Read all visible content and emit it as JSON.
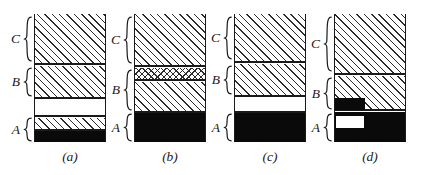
{
  "figure": {
    "width": 432,
    "height": 175,
    "background": "#ffffff",
    "ink": "#1a1a1a",
    "fill_black": "#0a0a0a"
  },
  "tier_labels": {
    "c": "C",
    "b": "B",
    "a": "A"
  },
  "panels": [
    {
      "id": "panel-a",
      "caption": "(a)",
      "column": {
        "left": 34,
        "width": 72
      },
      "caption_center": 70,
      "bands": [
        {
          "name": "band-c-hatch",
          "fill": "hatch",
          "top": 0,
          "height": 50
        },
        {
          "name": "band-b-hatch",
          "fill": "hatch",
          "top": 52,
          "height": 32
        },
        {
          "name": "band-gap-blank",
          "fill": "blank",
          "top": 86,
          "height": 16
        },
        {
          "name": "band-a-hatch",
          "fill": "hatch",
          "top": 104,
          "height": 12
        },
        {
          "name": "band-a-solid",
          "fill": "solid",
          "top": 116,
          "height": 12
        }
      ],
      "rules": [
        50,
        84,
        102,
        116
      ],
      "insets": [],
      "braces": [
        {
          "name": "brace-c",
          "tier": "C",
          "top": 2,
          "height": 46
        },
        {
          "name": "brace-b",
          "tier": "B",
          "top": 53,
          "height": 30
        },
        {
          "name": "brace-a",
          "tier": "A",
          "top": 103,
          "height": 25
        }
      ]
    },
    {
      "id": "panel-b",
      "caption": "(b)",
      "column": {
        "left": 134,
        "width": 72
      },
      "caption_center": 170,
      "bands": [
        {
          "name": "band-c-hatch",
          "fill": "hatch",
          "top": 0,
          "height": 52
        },
        {
          "name": "band-crosshatch",
          "fill": "crosshatch",
          "top": 54,
          "height": 12
        },
        {
          "name": "band-b-hatch",
          "fill": "hatch",
          "top": 68,
          "height": 30
        },
        {
          "name": "band-a-solid",
          "fill": "solid",
          "top": 98,
          "height": 30
        }
      ],
      "rules": [
        52,
        66,
        98
      ],
      "insets": [],
      "braces": [
        {
          "name": "brace-c",
          "tier": "C",
          "top": 2,
          "height": 48
        },
        {
          "name": "brace-b",
          "tier": "B",
          "top": 55,
          "height": 42
        },
        {
          "name": "brace-a",
          "tier": "A",
          "top": 99,
          "height": 29
        }
      ]
    },
    {
      "id": "panel-c",
      "caption": "(c)",
      "column": {
        "left": 234,
        "width": 72
      },
      "caption_center": 270,
      "bands": [
        {
          "name": "band-c-hatch",
          "fill": "hatch",
          "top": 0,
          "height": 48
        },
        {
          "name": "band-b-hatch",
          "fill": "hatch",
          "top": 50,
          "height": 32
        },
        {
          "name": "band-gap-blank",
          "fill": "blank",
          "top": 84,
          "height": 14
        },
        {
          "name": "band-a-solid",
          "fill": "solid",
          "top": 98,
          "height": 30
        }
      ],
      "rules": [
        48,
        82,
        98
      ],
      "insets": [],
      "braces": [
        {
          "name": "brace-c",
          "tier": "C",
          "top": 2,
          "height": 44
        },
        {
          "name": "brace-b",
          "tier": "B",
          "top": 51,
          "height": 30
        },
        {
          "name": "brace-a",
          "tier": "A",
          "top": 99,
          "height": 29
        }
      ]
    },
    {
      "id": "panel-d",
      "caption": "(d)",
      "column": {
        "left": 334,
        "width": 72
      },
      "caption_center": 370,
      "bands": [
        {
          "name": "band-c-hatch",
          "fill": "hatch",
          "top": 0,
          "height": 60
        },
        {
          "name": "band-b-hatch",
          "fill": "hatch",
          "top": 62,
          "height": 34
        },
        {
          "name": "band-a-solid",
          "fill": "solid",
          "top": 98,
          "height": 30
        }
      ],
      "rules": [
        60,
        96
      ],
      "insets": [
        {
          "name": "inset-black-block-b",
          "style": "black",
          "left": 0,
          "top": 84,
          "width": 30,
          "height": 12
        },
        {
          "name": "inset-white-block-a",
          "style": "white",
          "left": 0,
          "top": 101,
          "width": 30,
          "height": 14
        }
      ],
      "braces": [
        {
          "name": "brace-c",
          "tier": "C",
          "top": 2,
          "height": 56
        },
        {
          "name": "brace-b",
          "tier": "B",
          "top": 63,
          "height": 33
        },
        {
          "name": "brace-a",
          "tier": "A",
          "top": 99,
          "height": 29
        }
      ]
    }
  ]
}
